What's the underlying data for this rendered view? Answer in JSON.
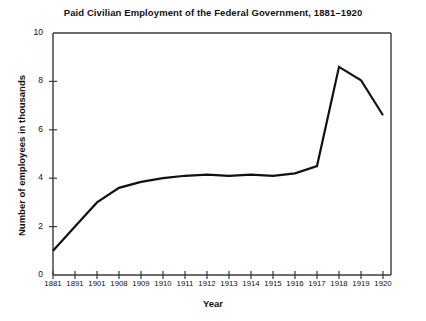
{
  "chart_data": {
    "type": "line",
    "title": "Paid Civilian Employment of the Federal Government, 1881–1920",
    "xlabel": "Year",
    "ylabel": "Number of employees in thousands",
    "categories": [
      "1881",
      "1891",
      "1901",
      "1908",
      "1909",
      "1910",
      "1911",
      "1912",
      "1913",
      "1914",
      "1915",
      "1916",
      "1917",
      "1918",
      "1919",
      "1920"
    ],
    "values": [
      1.0,
      2.0,
      3.0,
      3.6,
      3.85,
      4.0,
      4.1,
      4.15,
      4.1,
      4.15,
      4.1,
      4.2,
      4.5,
      8.6,
      8.05,
      6.6
    ],
    "ylim": [
      0,
      10
    ],
    "yticks": [
      0,
      2,
      4,
      6,
      8,
      10
    ],
    "ytick_labels": [
      "0",
      "2",
      "4",
      "6",
      "8",
      "10"
    ],
    "grid": false,
    "legend": false,
    "line_color": "#111111",
    "axis_color": "#3a3a3a",
    "background_color": "#ffffff"
  }
}
